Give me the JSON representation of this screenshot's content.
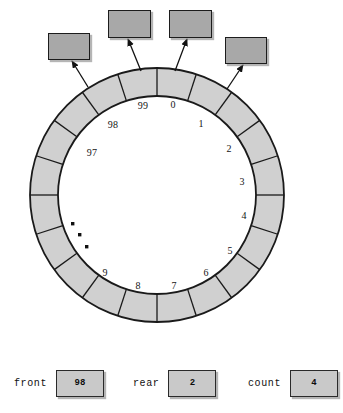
{
  "diagram": {
    "ring": {
      "segment_count": 20,
      "fill_color": "#d0d0d0",
      "stroke_color": "#1a1a1a",
      "center_x": 157,
      "center_y": 195,
      "outer_radius": 127,
      "inner_radius": 99
    },
    "slot_labels": [
      {
        "text": "0",
        "x": 173,
        "y": 104
      },
      {
        "text": "1",
        "x": 201,
        "y": 123
      },
      {
        "text": "2",
        "x": 229,
        "y": 148
      },
      {
        "text": "3",
        "x": 242,
        "y": 181
      },
      {
        "text": "4",
        "x": 244,
        "y": 215
      },
      {
        "text": "5",
        "x": 230,
        "y": 250
      },
      {
        "text": "6",
        "x": 206,
        "y": 272
      },
      {
        "text": "7",
        "x": 174,
        "y": 285
      },
      {
        "text": "8",
        "x": 138,
        "y": 285
      },
      {
        "text": "9",
        "x": 105,
        "y": 272
      },
      {
        "text": "97",
        "x": 92,
        "y": 152
      },
      {
        "text": "98",
        "x": 113,
        "y": 124
      },
      {
        "text": "99",
        "x": 143,
        "y": 105
      }
    ],
    "ellipsis_dots": [
      {
        "x": 71,
        "y": 222
      },
      {
        "x": 78,
        "y": 233
      },
      {
        "x": 85,
        "y": 245
      }
    ],
    "callouts": [
      {
        "label": "",
        "box_x": 48,
        "box_y": 33,
        "box_w": 40,
        "box_h": 25,
        "arrow_from_x": 88,
        "arrow_from_y": 87,
        "arrow_to_x": 72,
        "arrow_to_y": 61
      },
      {
        "label": "",
        "box_x": 108,
        "box_y": 10,
        "box_w": 41,
        "box_h": 26,
        "arrow_from_x": 141,
        "arrow_from_y": 71,
        "arrow_to_x": 128,
        "arrow_to_y": 39
      },
      {
        "label": "",
        "box_x": 169,
        "box_y": 10,
        "box_w": 41,
        "box_h": 26,
        "arrow_from_x": 175,
        "arrow_from_y": 71,
        "arrow_to_x": 187,
        "arrow_to_y": 39
      },
      {
        "label": "",
        "box_x": 225,
        "box_y": 37,
        "box_w": 40,
        "box_h": 25,
        "arrow_from_x": 227,
        "arrow_from_y": 89,
        "arrow_to_x": 243,
        "arrow_to_y": 65
      }
    ]
  },
  "status": {
    "items": [
      {
        "label": "front",
        "value": "98",
        "x": 14,
        "label_w": 48
      },
      {
        "label": "rear",
        "value": "2",
        "x": 133,
        "label_w": 40
      },
      {
        "label": "count",
        "value": "4",
        "x": 248,
        "label_w": 48
      }
    ]
  },
  "colors": {
    "ring_fill": "#d0d0d0",
    "box_fill": "#a8a8a8",
    "status_box_fill": "#c9c9c9",
    "outline": "#1a1a1a",
    "background": "#ffffff"
  }
}
